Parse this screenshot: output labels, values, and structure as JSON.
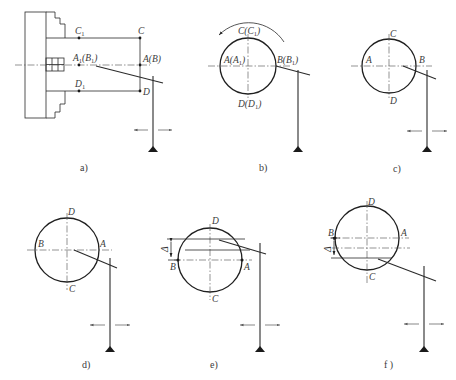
{
  "figure": {
    "panels": [
      {
        "id": "a",
        "caption": "a)",
        "labels": {
          "c1": "C",
          "c1_sub": "1",
          "c": "C",
          "a1b1_a": "A",
          "a1b1_a_sub": "1",
          "a1b1_b_open": "(B",
          "a1b1_b_sub": "1",
          "a1b1_close": ")",
          "ab": "A(B)",
          "d1": "D",
          "d1_sub": "1",
          "d": "D"
        },
        "description": "Lathe chuck holding workpiece with dial indicator touching end face"
      },
      {
        "id": "b",
        "caption": "b)",
        "labels": {
          "top": "C(C",
          "top_sub": "1",
          "top_close": ")",
          "left": "A(A",
          "left_sub": "1",
          "left_close": ")",
          "right": "B(B",
          "right_sub": "1",
          "right_close": ")",
          "bottom": "D(D",
          "bottom_sub": "1",
          "bottom_close": ")"
        },
        "rotation_arrow": "counter-clockwise",
        "description": "End view, indicator at B(B1)"
      },
      {
        "id": "c",
        "caption": "c)",
        "labels": {
          "top": "C",
          "left": "A",
          "right": "B",
          "bottom": "D"
        },
        "description": "Indicator at B"
      },
      {
        "id": "d",
        "caption": "d)",
        "labels": {
          "top": "D",
          "left": "B",
          "right": "A",
          "bottom": "C"
        },
        "description": "Rotated 180°, indicator at A"
      },
      {
        "id": "e",
        "caption": "e)",
        "labels": {
          "top": "D",
          "left": "B",
          "right": "A",
          "bottom": "C",
          "delta": "Δ"
        },
        "description": "Offset Δ above centerline"
      },
      {
        "id": "f",
        "caption": "f )",
        "labels": {
          "top": "D",
          "left": "B",
          "right": "A",
          "bottom": "C",
          "delta": "Δ"
        },
        "description": "Offset Δ below centerline"
      }
    ]
  }
}
